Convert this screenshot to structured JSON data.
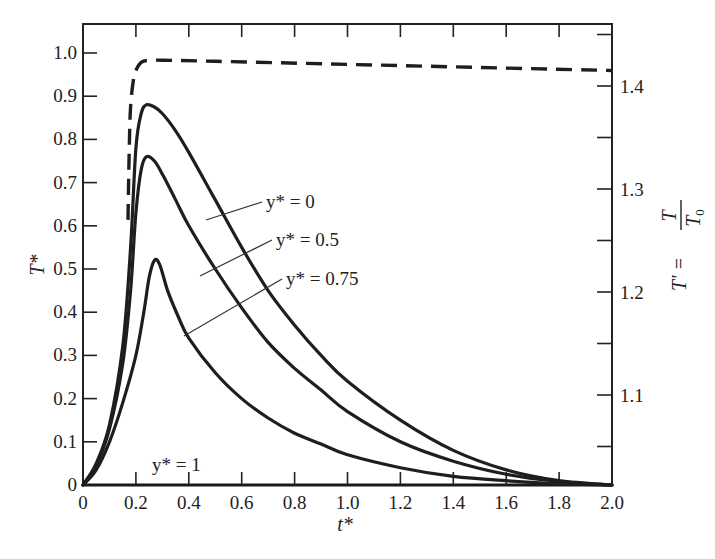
{
  "chart_data": {
    "type": "line",
    "title": "",
    "xlabel": "t*",
    "ylabel": "T*",
    "ylabel_right": "T' = T / T0",
    "xlim": [
      0,
      2.0
    ],
    "ylim": [
      0,
      1.06
    ],
    "ylim_right": [
      1.0,
      1.47
    ],
    "grid": false,
    "legend": "inline annotations with leader lines",
    "x_ticks": [
      "0",
      "0.2",
      "0.4",
      "0.6",
      "0.8",
      "1.0",
      "1.2",
      "1.4",
      "1.6",
      "1.8",
      "2.0"
    ],
    "y_ticks": [
      "0",
      "0.1",
      "0.2",
      "0.3",
      "0.4",
      "0.5",
      "0.6",
      "0.7",
      "0.8",
      "0.9",
      "1.0"
    ],
    "y_ticks_right": [
      "1.1",
      "1.2",
      "1.3",
      "1.4"
    ],
    "series": [
      {
        "name": "y* = 0",
        "axis": "left",
        "style": "solid",
        "x": [
          0,
          0.05,
          0.1,
          0.15,
          0.18,
          0.2,
          0.22,
          0.24,
          0.27,
          0.3,
          0.35,
          0.4,
          0.5,
          0.6,
          0.7,
          0.8,
          0.9,
          1.0,
          1.2,
          1.4,
          1.6,
          1.8,
          2.0
        ],
        "values": [
          0,
          0.05,
          0.14,
          0.32,
          0.55,
          0.78,
          0.86,
          0.88,
          0.875,
          0.86,
          0.82,
          0.77,
          0.66,
          0.55,
          0.45,
          0.37,
          0.3,
          0.24,
          0.15,
          0.08,
          0.035,
          0.01,
          0
        ]
      },
      {
        "name": "y* = 0.5",
        "axis": "left",
        "style": "solid",
        "x": [
          0,
          0.05,
          0.1,
          0.15,
          0.18,
          0.2,
          0.22,
          0.24,
          0.27,
          0.3,
          0.35,
          0.4,
          0.5,
          0.6,
          0.7,
          0.8,
          0.9,
          1.0,
          1.2,
          1.4,
          1.6,
          1.8,
          2.0
        ],
        "values": [
          0,
          0.045,
          0.13,
          0.28,
          0.45,
          0.63,
          0.73,
          0.76,
          0.75,
          0.72,
          0.66,
          0.6,
          0.5,
          0.41,
          0.33,
          0.27,
          0.22,
          0.17,
          0.1,
          0.055,
          0.025,
          0.008,
          0
        ]
      },
      {
        "name": "y* = 0.75",
        "axis": "left",
        "style": "solid",
        "x": [
          0,
          0.05,
          0.1,
          0.15,
          0.2,
          0.23,
          0.25,
          0.27,
          0.29,
          0.32,
          0.36,
          0.4,
          0.5,
          0.6,
          0.7,
          0.8,
          0.9,
          1.0,
          1.2,
          1.4,
          1.6,
          1.8,
          2.0
        ],
        "values": [
          0,
          0.035,
          0.1,
          0.19,
          0.3,
          0.4,
          0.48,
          0.52,
          0.51,
          0.45,
          0.39,
          0.34,
          0.26,
          0.2,
          0.155,
          0.12,
          0.095,
          0.07,
          0.04,
          0.02,
          0.01,
          0.003,
          0
        ]
      },
      {
        "name": "y* = 1",
        "axis": "left",
        "style": "solid",
        "x": [
          0,
          2.0
        ],
        "values": [
          0,
          0
        ]
      },
      {
        "name": "T' (dashed)",
        "axis": "right",
        "style": "dashed",
        "x": [
          0.17,
          0.175,
          0.18,
          0.19,
          0.2,
          0.22,
          0.25,
          0.3,
          0.5,
          1.0,
          1.5,
          2.0
        ],
        "values": [
          1.27,
          1.34,
          1.38,
          1.405,
          1.415,
          1.423,
          1.425,
          1.425,
          1.424,
          1.421,
          1.418,
          1.415
        ]
      }
    ],
    "annotations": [
      {
        "text": "y* = 0",
        "target_series": "y* = 0"
      },
      {
        "text": "y* = 0.5",
        "target_series": "y* = 0.5"
      },
      {
        "text": "y* = 0.75",
        "target_series": "y* = 0.75"
      },
      {
        "text": "y* = 1",
        "target_series": "y* = 1"
      }
    ]
  },
  "labels": {
    "y_left_title": "T*",
    "x_title": "t*",
    "right_title_prefix": "T' =",
    "right_title_num": "T",
    "right_title_den": "T",
    "right_title_den_sub": "0",
    "annot_y0": "y* = 0",
    "annot_y05": "y* = 0.5",
    "annot_y075": "y* = 0.75",
    "annot_y1": "y* = 1"
  }
}
